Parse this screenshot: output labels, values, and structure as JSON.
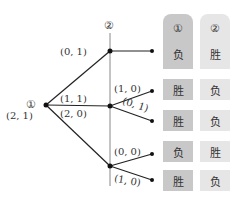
{
  "tree": {
    "root_label": "①",
    "root_payoff": "(2, 1)",
    "player2_label": "②",
    "branches": [
      {
        "label": "(0, 1)",
        "children": [
          {
            "label": ""
          }
        ]
      },
      {
        "label": "(1, 1)",
        "children": [
          {
            "label": "(1, 0)"
          },
          {
            "label": "(0, 1)"
          }
        ]
      },
      {
        "label": "(2, 0)",
        "children": [
          {
            "label": "(0, 0)"
          },
          {
            "label": "(1, 0)"
          }
        ]
      }
    ]
  },
  "table": {
    "headers": [
      "①",
      "②"
    ],
    "rows": [
      [
        "负",
        "胜"
      ],
      [
        "胜",
        "负"
      ],
      [
        "胜",
        "负"
      ],
      [
        "负",
        "胜"
      ],
      [
        "胜",
        "负"
      ]
    ]
  }
}
